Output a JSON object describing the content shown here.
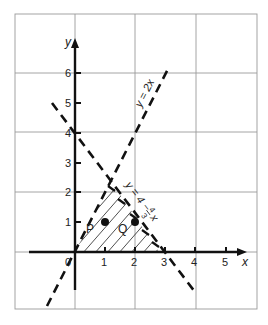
{
  "figure": {
    "type": "linear-inequality-region",
    "axes": {
      "x_label": "x",
      "y_label": "y",
      "origin_label": "0",
      "x_ticks": [
        "1",
        "2",
        "3",
        "4",
        "5"
      ],
      "y_ticks": [
        "1",
        "2",
        "3",
        "4",
        "5",
        "6"
      ]
    },
    "lines": [
      {
        "id": "line-a",
        "label": "y = 2x",
        "style": "dashed"
      },
      {
        "id": "line-b",
        "label_main": "y = 4 −",
        "label_frac_num": "4",
        "label_frac_den": "3",
        "label_var": "x",
        "style": "dashed"
      }
    ],
    "points": [
      {
        "label": "P",
        "x": 1,
        "y": 1
      },
      {
        "label": "Q",
        "x": 2,
        "y": 1
      }
    ],
    "region": {
      "description": "hatched triangle bounded by y = 2x, y = 4 − 4/3 x and the x-axis"
    },
    "colors": {
      "ink": "#111111",
      "grid": "#9a9a9a",
      "background": "#ffffff"
    }
  }
}
